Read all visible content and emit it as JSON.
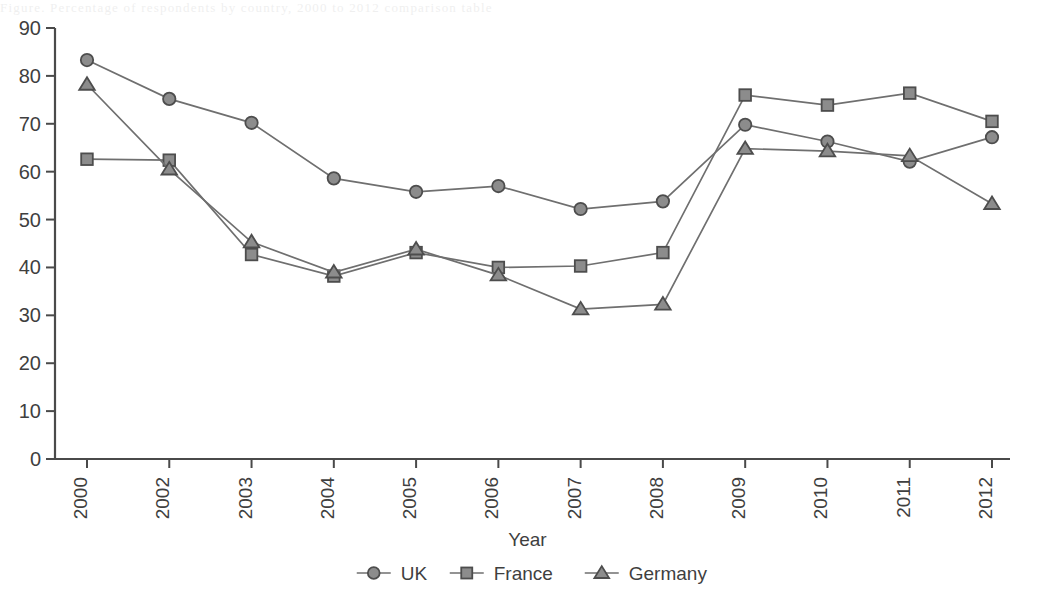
{
  "page": {
    "background_bleed_text": "Figure. Percentage of respondents by country, 2000 to 2012 comparison table",
    "colors": {
      "axis": "#4a4a4a",
      "line": "#6f6f6f",
      "marker_fill": "#8c8c8c",
      "marker_stroke": "#4d4d4d",
      "text": "#3f3f3f",
      "background": "#ffffff"
    }
  },
  "chart_data": {
    "type": "line",
    "title": "",
    "subtitle": "",
    "xlabel": "Year",
    "ylabel": "",
    "categories": [
      "2000",
      "2002",
      "2003",
      "2004",
      "2005",
      "2006",
      "2007",
      "2008",
      "2009",
      "2010",
      "2011",
      "2012"
    ],
    "ylim": [
      0,
      90
    ],
    "ytick_labels": [
      "0",
      "10",
      "20",
      "30",
      "40",
      "50",
      "60",
      "70",
      "80",
      "90"
    ],
    "yticks": [
      0,
      10,
      20,
      30,
      40,
      50,
      60,
      70,
      80,
      90
    ],
    "grid": false,
    "legend_position": "bottom",
    "series": [
      {
        "name": "UK",
        "marker": "circle",
        "values": [
          83.3,
          75.2,
          70.2,
          58.6,
          55.8,
          57.0,
          52.2,
          53.8,
          69.8,
          66.3,
          62.1,
          67.2
        ]
      },
      {
        "name": "France",
        "marker": "square",
        "values": [
          62.6,
          62.4,
          42.7,
          38.2,
          43.1,
          40.0,
          40.3,
          43.1,
          76.0,
          73.9,
          76.4,
          70.5
        ]
      },
      {
        "name": "Germany",
        "marker": "triangle",
        "values": [
          78.2,
          60.5,
          45.3,
          39.0,
          43.8,
          38.4,
          31.3,
          32.3,
          64.8,
          64.3,
          63.3,
          53.3
        ]
      }
    ]
  }
}
